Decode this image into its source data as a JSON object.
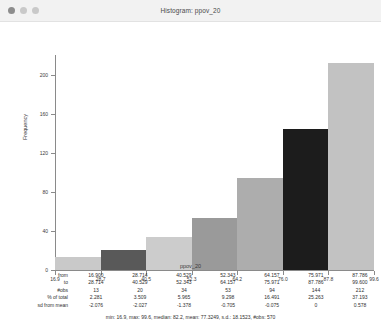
{
  "window": {
    "title": "Histogram: ppov_20",
    "buttons": [
      "close-dot",
      "minimize-dot",
      "zoom-dot"
    ]
  },
  "chart_data": {
    "type": "bar",
    "title": "Histogram: ppov_20",
    "xlabel": "ppov_20",
    "ylabel": "Frequency",
    "categories": [
      "16.900-28.714",
      "28.714-40.529",
      "40.529-52.343",
      "52.343-64.157",
      "64.157-75.971",
      "75.971-87.786",
      "87.786-99.600"
    ],
    "values": [
      13,
      20,
      34,
      53,
      94,
      144,
      212
    ],
    "bar_colors": [
      "#c9c9c9",
      "#595959",
      "#cccccc",
      "#9a9a9a",
      "#adadad",
      "#1c1c1c",
      "#c2c2c2"
    ],
    "xticks": [
      "16.9",
      "28.7",
      "40.5",
      "52.3",
      "64.2",
      "76.0",
      "87.8",
      "99.6"
    ],
    "xlim": [
      16.9,
      99.6
    ],
    "yticks": [
      "0",
      "40",
      "80",
      "120",
      "160",
      "200"
    ],
    "ylim": [
      0,
      220
    ],
    "grid": false,
    "legend": "none"
  },
  "table": {
    "row_labels": [
      "from",
      "to",
      "#obs",
      "% of total",
      "sd from mean"
    ],
    "rows": {
      "from": [
        "16.900",
        "28.714",
        "40.529",
        "52.343",
        "64.157",
        "75.971",
        "87.786"
      ],
      "to": [
        "28.714",
        "40.529",
        "52.343",
        "64.157",
        "75.971",
        "87.786",
        "99.600"
      ],
      "obs": [
        "13",
        "20",
        "34",
        "53",
        "94",
        "144",
        "212"
      ],
      "pct": [
        "2.281",
        "3.509",
        "5.965",
        "9.298",
        "16.491",
        "25.263",
        "37.193"
      ],
      "sd": [
        "-2.076",
        "-2.027",
        "-1.378",
        "-0.705",
        "-0.075",
        "0",
        "0.578"
      ]
    }
  },
  "summary": "min: 16.9, max: 99.6, median: 82.2, mean: 77.3249, s.d.: 18.1523, #obs: 570"
}
